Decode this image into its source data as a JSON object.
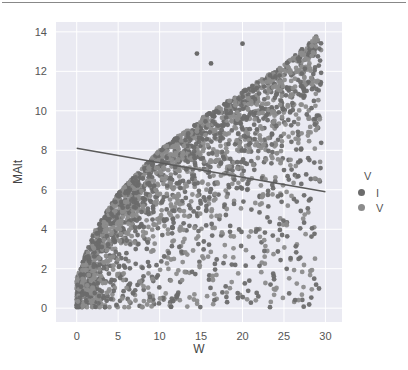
{
  "chart_data": {
    "type": "scatter",
    "title": "",
    "xlabel": "W",
    "ylabel": "MAlt",
    "xlim": [
      -2.5,
      32
    ],
    "ylim": [
      -0.7,
      14.5
    ],
    "xticks": [
      0,
      5,
      10,
      15,
      20,
      25,
      30
    ],
    "yticks": [
      0,
      2,
      4,
      6,
      8,
      10,
      12,
      14
    ],
    "grid": true,
    "background": "#eaeaf2",
    "legend": {
      "title": "V",
      "position": "right",
      "entries": [
        {
          "label": "I",
          "color": "#6b6b6b"
        },
        {
          "label": "V",
          "color": "#8c8c8c"
        }
      ]
    },
    "series": [
      {
        "name": "I",
        "color": "#6b6b6b",
        "description": "Dense cloud of ~3000 points; upper envelope MAlt ≈ 2.6*sqrt(W) (reaching ~13.8 at W≈29), lower envelope ≈ 0; densest near upper envelope and near origin",
        "envelope_upper": [
          [
            0,
            1.5
          ],
          [
            2,
            3.8
          ],
          [
            5,
            5.8
          ],
          [
            10,
            8.0
          ],
          [
            15,
            9.6
          ],
          [
            20,
            11.0
          ],
          [
            25,
            12.3
          ],
          [
            29,
            13.8
          ]
        ],
        "x_range": [
          0,
          29.5
        ]
      },
      {
        "name": "V",
        "color": "#8c8c8c",
        "description": "Overlapping points, same distribution",
        "x_range": [
          0,
          29.5
        ]
      }
    ],
    "outliers": [
      [
        14.5,
        12.9
      ],
      [
        16.2,
        12.4
      ],
      [
        20.0,
        13.4
      ]
    ],
    "regression_line": {
      "x": [
        0,
        30
      ],
      "y": [
        8.1,
        5.9
      ],
      "color": "#5a5a5a"
    }
  }
}
